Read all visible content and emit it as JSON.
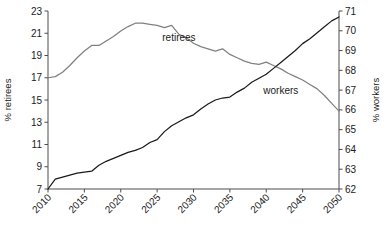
{
  "chart_data": {
    "type": "line",
    "title": "",
    "xlabel": "",
    "ylabel": "% retirees",
    "y2label": "% workers",
    "grid": false,
    "legend": "inline-annotations",
    "xlim": [
      2010,
      2050
    ],
    "ylim": [
      7,
      23
    ],
    "y2lim": [
      62,
      71
    ],
    "xticks": [
      2010,
      2015,
      2020,
      2025,
      2030,
      2035,
      2040,
      2045,
      2050
    ],
    "yticks": [
      7,
      9,
      11,
      13,
      15,
      17,
      19,
      21,
      23
    ],
    "y2ticks": [
      62,
      63,
      64,
      65,
      66,
      67,
      68,
      69,
      70,
      71
    ],
    "x": [
      2010,
      2011,
      2012,
      2013,
      2014,
      2015,
      2016,
      2017,
      2018,
      2019,
      2020,
      2021,
      2022,
      2023,
      2024,
      2025,
      2026,
      2027,
      2028,
      2029,
      2030,
      2031,
      2032,
      2033,
      2034,
      2035,
      2036,
      2037,
      2038,
      2039,
      2040,
      2041,
      2042,
      2043,
      2044,
      2045,
      2046,
      2047,
      2048,
      2049,
      2050
    ],
    "series": [
      {
        "name": "retirees",
        "axis": "left",
        "color": "#808080",
        "label_x": 2028,
        "label_y": 20.6,
        "values": [
          17.0,
          17.1,
          17.5,
          18.1,
          18.8,
          19.4,
          19.9,
          19.9,
          20.3,
          20.7,
          21.2,
          21.6,
          21.9,
          21.9,
          21.8,
          21.7,
          21.5,
          21.7,
          20.9,
          20.6,
          20.1,
          19.8,
          19.6,
          19.4,
          19.6,
          19.1,
          18.8,
          18.5,
          18.3,
          18.2,
          18.4,
          18.1,
          17.8,
          17.4,
          17.1,
          16.8,
          16.4,
          16.0,
          15.4,
          14.7,
          14.0
        ],
        "values_right_axis_equivalent": null
      },
      {
        "name": "workers",
        "axis": "right",
        "color": "#1a1a1a",
        "label_x": 2042,
        "label_y": 67.0,
        "values": [
          62.0,
          62.5,
          62.6,
          62.7,
          62.8,
          62.85,
          62.9,
          63.2,
          63.4,
          63.55,
          63.7,
          63.85,
          63.95,
          64.1,
          64.35,
          64.5,
          64.9,
          65.2,
          65.4,
          65.6,
          65.75,
          66.05,
          66.3,
          66.5,
          66.6,
          66.65,
          66.9,
          67.1,
          67.4,
          67.6,
          67.8,
          68.1,
          68.4,
          68.7,
          69.0,
          69.35,
          69.6,
          69.9,
          70.2,
          70.5,
          70.7
        ]
      }
    ],
    "crossover_year_approx": 2038
  },
  "labels": {
    "y_left_title": "% retirees",
    "y_right_title": "% workers",
    "series_retirees": "retirees",
    "series_workers": "workers"
  }
}
